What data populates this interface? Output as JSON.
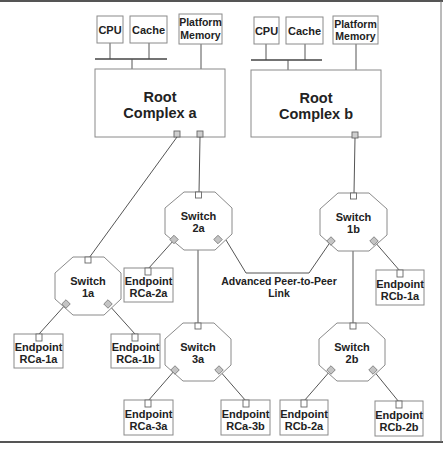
{
  "diagram": {
    "root_complexes": [
      {
        "id": "rc-a",
        "label_line1": "Root",
        "label_line2": "Complex a",
        "cpu": "CPU",
        "cache": "Cache",
        "memory_line1": "Platform",
        "memory_line2": "Memory"
      },
      {
        "id": "rc-b",
        "label_line1": "Root",
        "label_line2": "Complex b",
        "cpu": "CPU",
        "cache": "Cache",
        "memory_line1": "Platform",
        "memory_line2": "Memory"
      }
    ],
    "switches": {
      "s1a": {
        "line1": "Switch",
        "line2": "1a"
      },
      "s2a": {
        "line1": "Switch",
        "line2": "2a"
      },
      "s3a": {
        "line1": "Switch",
        "line2": "3a"
      },
      "s1b": {
        "line1": "Switch",
        "line2": "1b"
      },
      "s2b": {
        "line1": "Switch",
        "line2": "2b"
      }
    },
    "endpoints": {
      "rca1a": {
        "line1": "Endpoint",
        "line2": "RCa-1a"
      },
      "rca1b": {
        "line1": "Endpoint",
        "line2": "RCa-1b"
      },
      "rca2a": {
        "line1": "Endpoint",
        "line2": "RCa-2a"
      },
      "rca3a": {
        "line1": "Endpoint",
        "line2": "RCa-3a"
      },
      "rca3b": {
        "line1": "Endpoint",
        "line2": "RCa-3b"
      },
      "rcb1a": {
        "line1": "Endpoint",
        "line2": "RCb-1a"
      },
      "rcb2a": {
        "line1": "Endpoint",
        "line2": "RCb-2a"
      },
      "rcb2b": {
        "line1": "Endpoint",
        "line2": "RCb-2b"
      }
    },
    "peer_link": {
      "line1": "Advanced Peer-to-Peer",
      "line2": "Link"
    }
  }
}
